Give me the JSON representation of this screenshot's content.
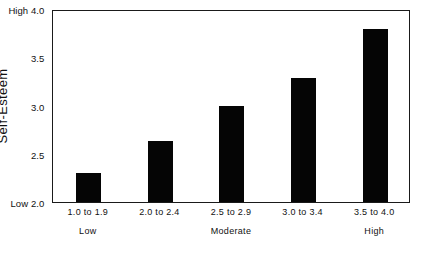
{
  "chart_data": {
    "type": "bar",
    "title": "",
    "xlabel": "",
    "ylabel": "Self-Esteem",
    "categories": [
      "1.0 to 1.9",
      "2.0 to 2.4",
      "2.5 to 2.9",
      "3.0 to 3.4",
      "3.5 to 4.0"
    ],
    "values": [
      2.3,
      2.63,
      2.99,
      3.29,
      3.79
    ],
    "ylim": [
      2.0,
      4.0
    ],
    "yticks": [
      2.0,
      2.5,
      3.0,
      3.5,
      4.0
    ],
    "ytick_labels": [
      "2.0",
      "2.5",
      "3.0",
      "3.5",
      "4.0"
    ],
    "ytick_prefixes": [
      "Low",
      "",
      "",
      "",
      "High"
    ],
    "group_labels": [
      "Low",
      "Moderate",
      "High"
    ],
    "group_positions": [
      0,
      2,
      4
    ],
    "grid": false,
    "legend": null,
    "bar_color": "#050505",
    "background_color": "#ffffff",
    "frame_color": "#1a1a1a"
  },
  "axes": {
    "y_title": "Self-Esteem",
    "y_top_label": "High 4.0",
    "y_bottom_label": "Low 2.0"
  }
}
